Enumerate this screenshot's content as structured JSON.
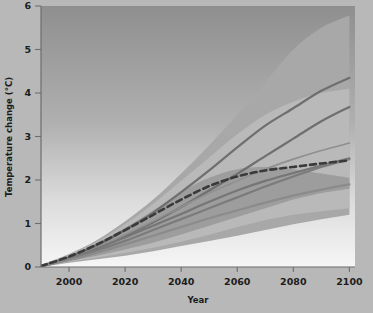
{
  "figure": {
    "background_color": "#b8b8b8",
    "plot_bg_top": "#949494",
    "plot_bg_bottom": "#f2f2f2"
  },
  "chart_data": {
    "type": "line",
    "title": "",
    "xlabel": "Year",
    "ylabel": "Temperature change (°C)",
    "xlim": [
      1990,
      2102
    ],
    "ylim": [
      0,
      6
    ],
    "xticks": [
      2000,
      2020,
      2040,
      2060,
      2080,
      2100
    ],
    "xtick_labels": [
      "2000",
      "2020",
      "2040",
      "2060",
      "2080",
      "2100"
    ],
    "yticks": [
      0,
      1,
      2,
      3,
      4,
      5,
      6
    ],
    "ytick_labels": [
      "0",
      "1",
      "2",
      "3",
      "4",
      "5",
      "6"
    ],
    "grid": false,
    "legend": "none",
    "x": [
      1990,
      2000,
      2010,
      2020,
      2030,
      2040,
      2050,
      2060,
      2070,
      2080,
      2090,
      2100
    ],
    "bands": [
      {
        "name": "full-range-envelope",
        "color": "#a8a8a8",
        "opacity": 1,
        "upper": [
          0.05,
          0.3,
          0.62,
          1.05,
          1.55,
          2.15,
          2.8,
          3.5,
          4.25,
          5.0,
          5.5,
          5.78
        ],
        "lower": [
          0.0,
          0.1,
          0.18,
          0.26,
          0.36,
          0.48,
          0.6,
          0.72,
          0.85,
          0.98,
          1.1,
          1.2
        ]
      },
      {
        "name": "likely-range-envelope",
        "color": "#b9b9b9",
        "opacity": 1,
        "upper": [
          0.05,
          0.28,
          0.58,
          0.98,
          1.45,
          1.98,
          2.52,
          3.05,
          3.5,
          3.8,
          4.0,
          4.1
        ],
        "lower": [
          0.0,
          0.12,
          0.22,
          0.32,
          0.44,
          0.58,
          0.74,
          0.92,
          1.08,
          1.2,
          1.28,
          1.35
        ]
      },
      {
        "name": "inner-range-envelope",
        "color": "#9d9d9d",
        "opacity": 1,
        "upper": [
          0.05,
          0.26,
          0.55,
          0.9,
          1.3,
          1.72,
          2.05,
          2.25,
          2.3,
          2.25,
          2.15,
          2.05
        ],
        "lower": [
          0.0,
          0.14,
          0.26,
          0.4,
          0.56,
          0.75,
          0.95,
          1.15,
          1.35,
          1.55,
          1.7,
          1.8
        ]
      }
    ],
    "series": [
      {
        "name": "scenario-a1fi",
        "style": "solid",
        "color": "#6f6f6f",
        "width": 2.2,
        "values": [
          0.02,
          0.22,
          0.5,
          0.85,
          1.25,
          1.72,
          2.22,
          2.75,
          3.25,
          3.65,
          4.05,
          4.35
        ]
      },
      {
        "name": "scenario-a2",
        "style": "solid",
        "color": "#6f6f6f",
        "width": 2.2,
        "values": [
          0.02,
          0.2,
          0.44,
          0.72,
          1.03,
          1.38,
          1.76,
          2.14,
          2.55,
          2.95,
          3.35,
          3.68
        ]
      },
      {
        "name": "scenario-a1b",
        "style": "solid",
        "color": "#8f8f8f",
        "width": 1.6,
        "values": [
          0.02,
          0.2,
          0.45,
          0.74,
          1.05,
          1.38,
          1.7,
          1.98,
          2.25,
          2.48,
          2.68,
          2.85
        ]
      },
      {
        "name": "scenario-b2",
        "style": "solid",
        "color": "#767676",
        "width": 2.2,
        "values": [
          0.02,
          0.19,
          0.42,
          0.68,
          0.95,
          1.22,
          1.5,
          1.76,
          1.98,
          2.16,
          2.33,
          2.5
        ]
      },
      {
        "name": "scenario-b1",
        "style": "solid",
        "color": "#7b7b7b",
        "width": 2.2,
        "values": [
          0.02,
          0.18,
          0.38,
          0.6,
          0.85,
          1.1,
          1.35,
          1.6,
          1.85,
          2.08,
          2.3,
          2.48
        ]
      },
      {
        "name": "scenario-constant-composition",
        "style": "solid",
        "color": "#8b8b8b",
        "width": 2.2,
        "values": [
          0.02,
          0.16,
          0.33,
          0.52,
          0.72,
          0.92,
          1.12,
          1.3,
          1.48,
          1.64,
          1.78,
          1.9
        ]
      },
      {
        "name": "scenario-multi-model-mean",
        "style": "dashed",
        "color": "#3a3a3a",
        "width": 2.6,
        "values": [
          0.02,
          0.24,
          0.52,
          0.85,
          1.2,
          1.55,
          1.86,
          2.08,
          2.22,
          2.3,
          2.38,
          2.45
        ]
      }
    ]
  }
}
